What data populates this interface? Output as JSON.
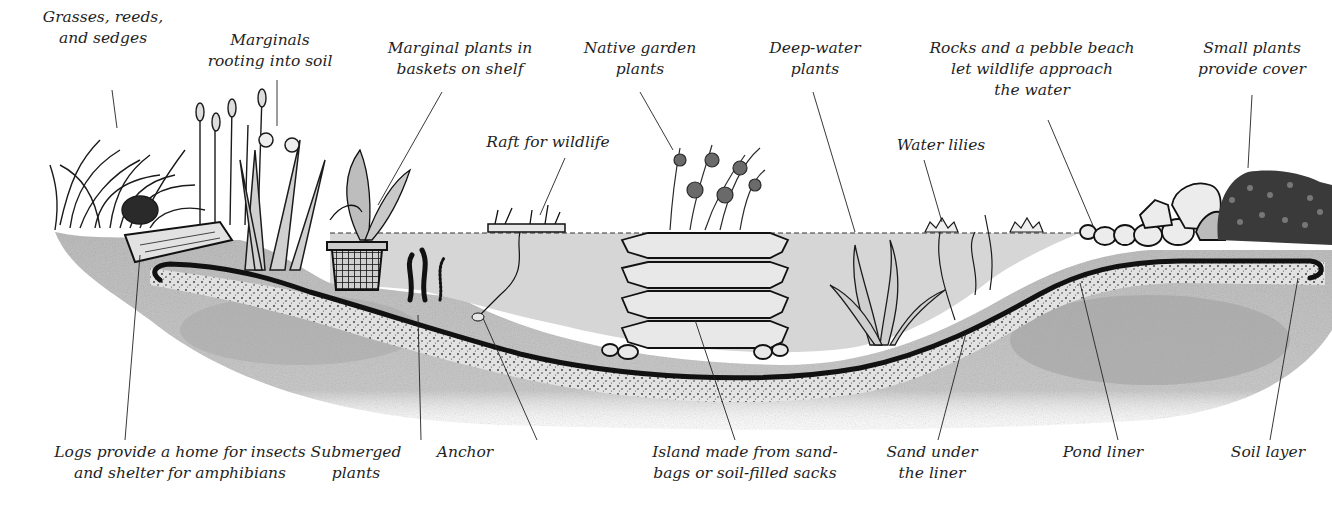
{
  "diagram": {
    "colors": {
      "soil": "#b9b9b9",
      "soil_dark": "#9e9e9e",
      "water": "#d4d4d4",
      "liner": "#111111",
      "ink": "#1a1a1a",
      "background": "#ffffff"
    },
    "top_labels": [
      {
        "id": "grasses",
        "lines": [
          "Grasses, reeds,",
          "and sedges"
        ],
        "x": 103,
        "y": 7
      },
      {
        "id": "marginals-soil",
        "lines": [
          "Marginals",
          "rooting into soil"
        ],
        "x": 270,
        "y": 30
      },
      {
        "id": "marginals-baskets",
        "lines": [
          "Marginal plants in",
          "baskets on shelf"
        ],
        "x": 460,
        "y": 38
      },
      {
        "id": "native-plants",
        "lines": [
          "Native garden",
          "plants"
        ],
        "x": 640,
        "y": 38
      },
      {
        "id": "deep-water",
        "lines": [
          "Deep-water",
          "plants"
        ],
        "x": 815,
        "y": 38
      },
      {
        "id": "raft",
        "lines": [
          "Raft for wildlife"
        ],
        "x": 548,
        "y": 132
      },
      {
        "id": "water-lilies",
        "lines": [
          "Water lilies"
        ],
        "x": 941,
        "y": 135
      },
      {
        "id": "rocks-beach",
        "lines": [
          "Rocks and a pebble beach",
          "let wildlife approach",
          "the water"
        ],
        "x": 1032,
        "y": 38
      },
      {
        "id": "small-plants",
        "lines": [
          "Small plants",
          "provide cover"
        ],
        "x": 1252,
        "y": 38
      }
    ],
    "bottom_labels": [
      {
        "id": "logs",
        "lines": [
          "Logs provide a home for insects",
          "and shelter for amphibians"
        ],
        "x": 180,
        "y": 442
      },
      {
        "id": "submerged",
        "lines": [
          "Submerged",
          "plants"
        ],
        "x": 356,
        "y": 442
      },
      {
        "id": "anchor",
        "lines": [
          "Anchor"
        ],
        "x": 465,
        "y": 442
      },
      {
        "id": "island",
        "lines": [
          "Island made from sand-",
          "bags or soil-filled sacks"
        ],
        "x": 745,
        "y": 442
      },
      {
        "id": "sand",
        "lines": [
          "Sand under",
          "the liner"
        ],
        "x": 932,
        "y": 442
      },
      {
        "id": "pond-liner",
        "lines": [
          "Pond liner"
        ],
        "x": 1103,
        "y": 442
      },
      {
        "id": "soil-layer",
        "lines": [
          "Soil layer"
        ],
        "x": 1268,
        "y": 442
      }
    ],
    "leader_lines": [
      {
        "id": "grasses",
        "x1": 112,
        "y1": 90,
        "x2": 117,
        "y2": 128
      },
      {
        "id": "marginals-soil",
        "x1": 277,
        "y1": 80,
        "x2": 277,
        "y2": 126
      },
      {
        "id": "marginals-baskets",
        "x1": 442,
        "y1": 92,
        "x2": 378,
        "y2": 205
      },
      {
        "id": "native-plants",
        "x1": 640,
        "y1": 92,
        "x2": 673,
        "y2": 150
      },
      {
        "id": "deep-water",
        "x1": 813,
        "y1": 92,
        "x2": 855,
        "y2": 232
      },
      {
        "id": "raft",
        "x1": 565,
        "y1": 158,
        "x2": 540,
        "y2": 215
      },
      {
        "id": "water-lilies",
        "x1": 924,
        "y1": 160,
        "x2": 942,
        "y2": 222
      },
      {
        "id": "rocks-beach",
        "x1": 1048,
        "y1": 120,
        "x2": 1094,
        "y2": 228
      },
      {
        "id": "small-plants",
        "x1": 1252,
        "y1": 95,
        "x2": 1248,
        "y2": 168
      },
      {
        "id": "logs",
        "x1": 140,
        "y1": 255,
        "x2": 125,
        "y2": 440
      },
      {
        "id": "submerged",
        "x1": 418,
        "y1": 315,
        "x2": 421,
        "y2": 440
      },
      {
        "id": "anchor",
        "x1": 483,
        "y1": 318,
        "x2": 537,
        "y2": 440
      },
      {
        "id": "island",
        "x1": 695,
        "y1": 320,
        "x2": 735,
        "y2": 440
      },
      {
        "id": "sand",
        "x1": 966,
        "y1": 333,
        "x2": 938,
        "y2": 440
      },
      {
        "id": "pond-liner",
        "x1": 1080,
        "y1": 283,
        "x2": 1118,
        "y2": 440
      },
      {
        "id": "soil-layer",
        "x1": 1298,
        "y1": 278,
        "x2": 1270,
        "y2": 440
      }
    ]
  }
}
